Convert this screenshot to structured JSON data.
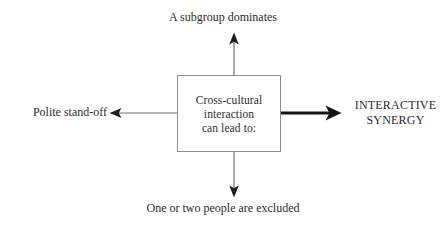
{
  "diagram": {
    "type": "radiating-outcome-diagram",
    "center": {
      "lines": [
        "Cross-cultural",
        "interaction",
        "can lead to:"
      ]
    },
    "outcomes": {
      "top": {
        "label": "A subgroup dominates",
        "direction": "up",
        "emphasis": "normal"
      },
      "bottom": {
        "label": "One or two people are excluded",
        "direction": "down",
        "emphasis": "normal"
      },
      "left": {
        "label": "Polite stand-off",
        "direction": "left",
        "emphasis": "normal"
      },
      "right": {
        "label_line_1": "INTERACTIVE",
        "label_line_2": "SYNERGY",
        "direction": "right",
        "emphasis": "bold"
      }
    },
    "colors": {
      "stroke": "#2b2b2b",
      "box_border": "#8d8d8d",
      "text": "#2b2b2b",
      "background": "#ffffff"
    }
  }
}
